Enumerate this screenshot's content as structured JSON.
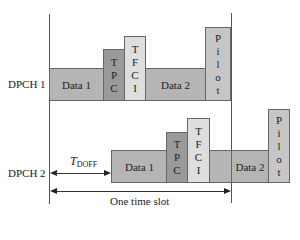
{
  "diagram": {
    "channels": [
      {
        "label": "DPCH 1",
        "fields": [
          {
            "name": "data-1",
            "label": "Data 1"
          },
          {
            "name": "tpc",
            "letters": [
              "T",
              "P",
              "C"
            ]
          },
          {
            "name": "tfci",
            "letters": [
              "T",
              "F",
              "C",
              "I"
            ]
          },
          {
            "name": "data-2",
            "label": "Data 2"
          },
          {
            "name": "pilot",
            "letters": [
              "P",
              "i",
              "l",
              "o",
              "t"
            ]
          }
        ]
      },
      {
        "label": "DPCH 2",
        "fields": [
          {
            "name": "data-1",
            "label": "Data 1"
          },
          {
            "name": "tpc",
            "letters": [
              "T",
              "P",
              "C"
            ]
          },
          {
            "name": "tfci",
            "letters": [
              "T",
              "F",
              "C",
              "I"
            ]
          },
          {
            "name": "data-2",
            "label": "Data 2"
          },
          {
            "name": "pilot",
            "letters": [
              "P",
              "i",
              "l",
              "o",
              "t"
            ]
          }
        ]
      }
    ],
    "offset_label": {
      "main": "T",
      "sub": "DOFF"
    },
    "slot_label": "One time slot",
    "colors": {
      "data": "#b5b5b5",
      "tpc": "#9a9a9a",
      "tfci": "#dedede",
      "pilot": "#c6c6c6"
    }
  }
}
